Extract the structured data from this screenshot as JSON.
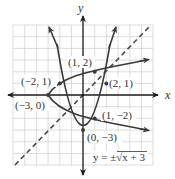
{
  "diagram": {
    "title": "",
    "axes": {
      "x_label": "x",
      "y_label": "y"
    },
    "grid": {
      "xmin": -6,
      "xmax": 6,
      "ymin": -6,
      "ymax": 6,
      "unit": 1
    },
    "curves": [
      {
        "name": "parabola",
        "equation": "y = x^2 - 3",
        "style": "solid"
      },
      {
        "name": "inverse",
        "equation": "y = ±√(x + 3)",
        "style": "solid"
      },
      {
        "name": "identity-line",
        "equation": "y = x",
        "style": "dashed"
      }
    ],
    "points": [
      {
        "label": "(−2, 1)",
        "x": -2,
        "y": 1
      },
      {
        "label": "(1, 2)",
        "x": 1,
        "y": 2
      },
      {
        "label": "(2, 1)",
        "x": 2,
        "y": 1
      },
      {
        "label": "(−3, 0)",
        "x": -3,
        "y": 0
      },
      {
        "label": "(1, −2)",
        "x": 1,
        "y": -2
      },
      {
        "label": "(0, −3)",
        "x": 0,
        "y": -3
      }
    ],
    "equation_label": "y = ±√x + 3",
    "colors": {
      "curve": "#3a3a3a",
      "grid": "#cccccc",
      "axis": "#1a1a1a",
      "label": "#333333"
    }
  }
}
